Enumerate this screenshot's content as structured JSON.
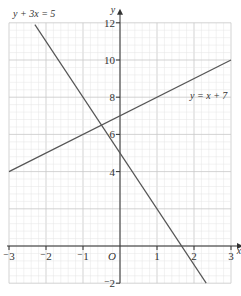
{
  "chart_data": {
    "type": "line",
    "title": "",
    "xlabel": "x",
    "ylabel": "y",
    "xlim": [
      -3,
      3
    ],
    "ylim": [
      -2,
      12
    ],
    "grid": true,
    "origin_label": "O",
    "x_ticks": [
      -3,
      -2,
      -1,
      1,
      2,
      3
    ],
    "y_ticks": [
      -2,
      4,
      6,
      8,
      10,
      12
    ],
    "x_tick_labels": [
      "⁻3",
      "⁻2",
      "⁻1",
      "1",
      "2",
      "3"
    ],
    "y_tick_labels": [
      "⁻2",
      "4",
      "6",
      "8",
      "10",
      "12"
    ],
    "series": [
      {
        "name": "y + 3x = 5",
        "equation": "y = 5 - 3x",
        "points": [
          [
            -2.3,
            11.9
          ],
          [
            2.33,
            -2
          ]
        ]
      },
      {
        "name": "y = x + 7",
        "equation": "y = x + 7",
        "points": [
          [
            -3,
            4
          ],
          [
            3,
            10
          ]
        ]
      }
    ],
    "annotations": [
      {
        "text": "y + 3x = 5",
        "position": "top-left"
      },
      {
        "text": "y = x + 7",
        "position": "right, near (2.5, 8.7)"
      }
    ],
    "legend": "none (inline labels)"
  },
  "colors": {
    "grid_minor": "#e4e4e4",
    "grid_major": "#c8c8c8",
    "axis": "#333333",
    "line": "#555555"
  }
}
